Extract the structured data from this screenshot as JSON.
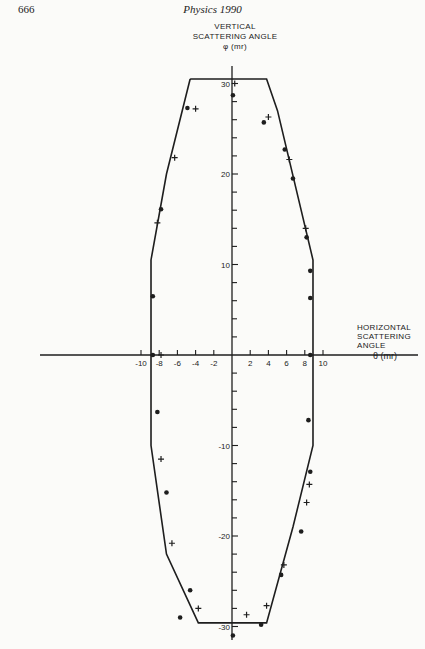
{
  "page": {
    "number": "666",
    "running_head": "Physics 1990"
  },
  "chart_data": {
    "type": "scatter",
    "title": "",
    "ylabel_lines": [
      "VERTICAL",
      "SCATTERING ANGLE",
      "φ (mr)"
    ],
    "xlabel_lines": [
      "HORIZONTAL",
      "SCATTERING",
      "ANGLE"
    ],
    "xunit": "θ (mr)",
    "xlim": [
      -10,
      10
    ],
    "ylim": [
      -30,
      30
    ],
    "x_tick_labels": [
      "-10",
      "-8",
      "-6",
      "-4",
      "-2",
      "2",
      "4",
      "6",
      "8",
      "10"
    ],
    "y_tick_labels": [
      "30",
      "20",
      "10",
      "-10",
      "-20",
      "-30"
    ],
    "grid": false,
    "legend": null,
    "series": [
      {
        "name": "acceptance boundary",
        "type": "line",
        "points": [
          [
            -4.6,
            30.5
          ],
          [
            3.8,
            30.5
          ],
          [
            5.0,
            27.0
          ],
          [
            8.9,
            10.5
          ],
          [
            8.9,
            -10.0
          ],
          [
            6.7,
            -19.0
          ],
          [
            3.8,
            -29.6
          ],
          [
            -3.7,
            -29.6
          ],
          [
            -7.2,
            -22.0
          ],
          [
            -8.9,
            -10.0
          ],
          [
            -8.9,
            10.5
          ],
          [
            -7.2,
            20.0
          ],
          [
            -4.6,
            30.5
          ]
        ]
      },
      {
        "name": "dots",
        "marker": "circle",
        "points": [
          [
            0.1,
            28.7
          ],
          [
            -4.9,
            27.3
          ],
          [
            3.5,
            25.7
          ],
          [
            -7.8,
            16.1
          ],
          [
            5.8,
            22.7
          ],
          [
            6.7,
            19.5
          ],
          [
            8.2,
            13.0
          ],
          [
            8.6,
            9.3
          ],
          [
            8.6,
            6.3
          ],
          [
            -8.7,
            6.5
          ],
          [
            -8.7,
            0
          ],
          [
            8.6,
            0
          ],
          [
            -8.2,
            -6.3
          ],
          [
            8.4,
            -7.2
          ],
          [
            8.6,
            -12.9
          ],
          [
            -7.2,
            -15.2
          ],
          [
            7.6,
            -19.5
          ],
          [
            5.4,
            -24.3
          ],
          [
            -4.6,
            -26.0
          ],
          [
            -5.7,
            -29.0
          ],
          [
            3.2,
            -29.8
          ],
          [
            0.1,
            -31.0
          ]
        ]
      },
      {
        "name": "crosses",
        "marker": "plus",
        "points": [
          [
            0.3,
            30.0
          ],
          [
            -4.0,
            27.2
          ],
          [
            4.0,
            26.3
          ],
          [
            -6.3,
            21.8
          ],
          [
            6.3,
            21.6
          ],
          [
            -8.2,
            14.6
          ],
          [
            8.1,
            14.0
          ],
          [
            -7.8,
            0
          ],
          [
            -7.8,
            -11.5
          ],
          [
            8.5,
            -14.3
          ],
          [
            8.2,
            -16.3
          ],
          [
            -6.6,
            -20.8
          ],
          [
            5.7,
            -23.2
          ],
          [
            -3.7,
            -28.0
          ],
          [
            1.6,
            -28.7
          ],
          [
            3.8,
            -27.7
          ]
        ]
      }
    ]
  }
}
